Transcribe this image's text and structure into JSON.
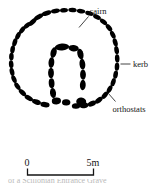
{
  "figure": {
    "type": "archaeological-plan",
    "labels": {
      "cairn": "cairn",
      "kerb": "kerb",
      "orthostats": "orthostats"
    },
    "scale": {
      "start_label": "0",
      "end_label": "5m",
      "unit": "m",
      "length_value": 5
    },
    "caption_fragment": "of a Scillonian Entrance Grave",
    "colors": {
      "stone_fill": "#000000",
      "line": "#141414",
      "background": "#ffffff"
    },
    "stones": {
      "kerb_count": 41,
      "orthostat_count": 13
    }
  }
}
